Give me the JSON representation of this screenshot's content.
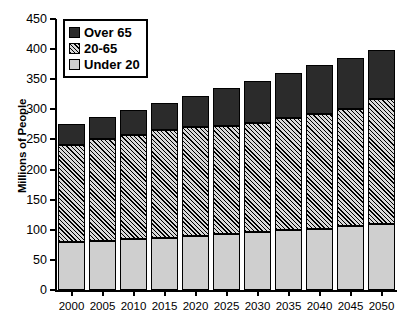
{
  "chart_data": {
    "type": "bar",
    "title": "",
    "subtitle": "",
    "xlabel": "",
    "ylabel": "Millions of People",
    "categories": [
      "2000",
      "2005",
      "2010",
      "2015",
      "2020",
      "2025",
      "2030",
      "2035",
      "2040",
      "2045",
      "2050"
    ],
    "ylim": [
      0,
      450
    ],
    "yticks": [
      0,
      50,
      100,
      150,
      200,
      250,
      300,
      350,
      400,
      450
    ],
    "ytick_labels": [
      "0",
      "50",
      "100",
      "150",
      "200",
      "250",
      "300",
      "350",
      "400",
      "450"
    ],
    "grid": false,
    "stacked": true,
    "legend_position": "top-left",
    "series": [
      {
        "name": "Under 20",
        "color": "#cfcfcf",
        "pattern": "solid-light-gray",
        "values": [
          80,
          82,
          84,
          87,
          90,
          93,
          96,
          99,
          102,
          106,
          110
        ]
      },
      {
        "name": "20-65",
        "color": "#d8d8d8",
        "pattern": "diagonal-hatch",
        "values": [
          160,
          168,
          174,
          178,
          180,
          180,
          181,
          186,
          190,
          194,
          208
        ]
      },
      {
        "name": "Over 65",
        "color": "#2b2b2b",
        "pattern": "solid-dark",
        "values": [
          35,
          37,
          41,
          46,
          53,
          62,
          70,
          76,
          81,
          85,
          80
        ]
      }
    ],
    "stack_tops": {
      "under_20": [
        80,
        82,
        84,
        87,
        90,
        93,
        96,
        99,
        102,
        106,
        110
      ],
      "through_20_65": [
        240,
        250,
        258,
        265,
        270,
        273,
        277,
        285,
        292,
        300,
        318
      ],
      "totals": [
        275,
        287,
        299,
        311,
        323,
        335,
        347,
        361,
        373,
        385,
        398
      ]
    }
  },
  "legend": {
    "items": [
      {
        "label": "Over 65",
        "swatch": "over65-swatch"
      },
      {
        "label": "20-65",
        "swatch": "series2065-swatch"
      },
      {
        "label": "Under 20",
        "swatch": "under20-swatch"
      }
    ]
  }
}
